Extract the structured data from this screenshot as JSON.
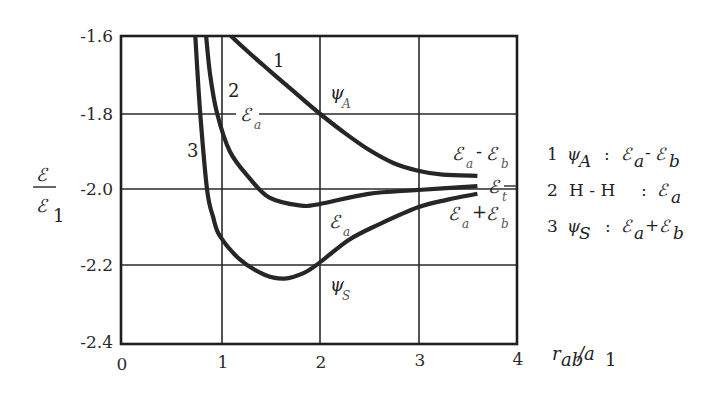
{
  "chart_data": {
    "type": "line",
    "title": "",
    "xlabel": "r_ab / a_1",
    "ylabel": "ℰ / ℰ_1",
    "xlim": [
      0,
      4
    ],
    "ylim": [
      -2.4,
      -1.6
    ],
    "grid": true,
    "x_ticks": [
      "0",
      "1",
      "2",
      "3",
      "4"
    ],
    "y_ticks": [
      "-1.6",
      "-1.8",
      "-2.0",
      "-2.2",
      "-2.4"
    ],
    "series": [
      {
        "name": "1",
        "label": "ψ_A : ℰ_a - ℰ_b",
        "x": [
          1.11,
          1.3,
          1.5,
          1.75,
          2.0,
          2.25,
          2.5,
          2.75,
          3.0,
          3.25,
          3.6
        ],
        "y": [
          -1.6,
          -1.645,
          -1.69,
          -1.745,
          -1.8,
          -1.85,
          -1.895,
          -1.93,
          -1.95,
          -1.96,
          -1.963
        ]
      },
      {
        "name": "2",
        "label": "H - H : ℰ_a",
        "x": [
          0.86,
          0.9,
          0.97,
          1.1,
          1.3,
          1.5,
          1.8,
          2.0,
          2.5,
          3.0,
          3.6
        ],
        "y": [
          -1.6,
          -1.7,
          -1.8,
          -1.9,
          -1.97,
          -2.02,
          -2.04,
          -2.037,
          -2.01,
          -2.0,
          -1.99
        ]
      },
      {
        "name": "3",
        "label": "ψ_S : ℰ_a + ℰ_b",
        "x": [
          0.75,
          0.8,
          0.87,
          0.93,
          1.0,
          1.2,
          1.45,
          1.65,
          1.85,
          2.0,
          2.3,
          2.6,
          3.0,
          3.3,
          3.6
        ],
        "y": [
          -1.6,
          -1.8,
          -2.0,
          -2.07,
          -2.12,
          -2.18,
          -2.22,
          -2.23,
          -2.215,
          -2.19,
          -2.13,
          -2.09,
          -2.045,
          -2.025,
          -2.01
        ]
      }
    ],
    "annotations": [
      {
        "text": "1",
        "x": 1.6,
        "y": -1.67
      },
      {
        "text": "2",
        "x": 1.1,
        "y": -1.75
      },
      {
        "text": "3",
        "x": 0.65,
        "y": -1.89
      },
      {
        "text": "ψ_A",
        "x": 2.15,
        "y": -1.77
      },
      {
        "text": "ℰ_a",
        "x": 1.35,
        "y": -1.81
      },
      {
        "text": "ℰ_a",
        "x": 2.15,
        "y": -2.1
      },
      {
        "text": "ψ_S",
        "x": 2.15,
        "y": -2.27
      },
      {
        "text": "ℰ_a - ℰ_b",
        "x": 3.35,
        "y": -1.91
      },
      {
        "text": "ℰ_t",
        "x": 3.75,
        "y": -1.99
      },
      {
        "text": "ℰ_a + ℰ_b",
        "x": 3.35,
        "y": -2.06
      }
    ]
  },
  "axis": {
    "y_label_num": "ℰ",
    "y_label_den": "ℰ",
    "y_label_den_sub": "1",
    "x_label_main": "r",
    "x_label_sub": "ab",
    "x_label_slash": "/a",
    "x_label_sub2": "1"
  },
  "curve_labels": {
    "one": "1",
    "two": "2",
    "three": "3",
    "psi_a": "ψ",
    "psi_a_sub": "A",
    "ea_top": "ℰ",
    "ea_top_sub": "a",
    "ea_mid": "ℰ",
    "ea_mid_sub": "a",
    "psi_s": "ψ",
    "psi_s_sub": "S",
    "diff_e1": "ℰ",
    "diff_e1_sub": "a",
    "diff_op": "-",
    "diff_e2": "ℰ",
    "diff_e2_sub": "b",
    "et": "ℰ",
    "et_sub": "t",
    "sum_e1": "ℰ",
    "sum_e1_sub": "a",
    "sum_op": "+",
    "sum_e2": "ℰ",
    "sum_e2_sub": "b"
  },
  "legend": [
    {
      "num": "1",
      "sym": "ψ",
      "sym_sub": "A",
      "colon": ":",
      "e1": "ℰ",
      "e1_sub": "a",
      "op": "-",
      "e2": "ℰ",
      "e2_sub": "b"
    },
    {
      "num": "2",
      "sym": "H - H",
      "colon": ":",
      "e1": "ℰ",
      "e1_sub": "a"
    },
    {
      "num": "3",
      "sym": "ψ",
      "sym_sub": "S",
      "colon": ":",
      "e1": "ℰ",
      "e1_sub": "a",
      "op": "+",
      "e2": "ℰ",
      "e2_sub": "b"
    }
  ]
}
